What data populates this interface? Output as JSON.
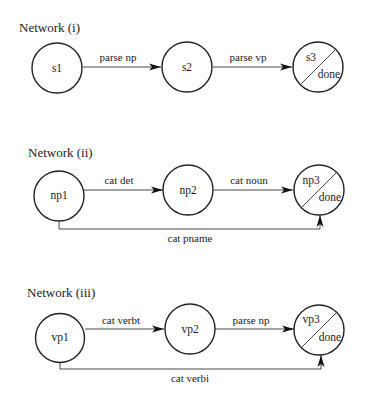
{
  "networks": [
    {
      "title": "Network (i)",
      "nodes": [
        {
          "id": "s1",
          "label": "s1",
          "final": false
        },
        {
          "id": "s2",
          "label": "s2",
          "final": false
        },
        {
          "id": "s3",
          "label": "s3",
          "final": true,
          "final_label": "done"
        }
      ],
      "edges": [
        {
          "from": "s1",
          "to": "s2",
          "label": "parse np",
          "kind": "forward"
        },
        {
          "from": "s2",
          "to": "s3",
          "label": "parse vp",
          "kind": "forward"
        }
      ]
    },
    {
      "title": "Network (ii)",
      "nodes": [
        {
          "id": "np1",
          "label": "np1",
          "final": false
        },
        {
          "id": "np2",
          "label": "np2",
          "final": false
        },
        {
          "id": "np3",
          "label": "np3",
          "final": true,
          "final_label": "done"
        }
      ],
      "edges": [
        {
          "from": "np1",
          "to": "np2",
          "label": "cat det",
          "kind": "forward"
        },
        {
          "from": "np2",
          "to": "np3",
          "label": "cat noun",
          "kind": "forward"
        },
        {
          "from": "np1",
          "to": "np3",
          "label": "cat pname",
          "kind": "bypass"
        }
      ]
    },
    {
      "title": "Network (iii)",
      "nodes": [
        {
          "id": "vp1",
          "label": "vp1",
          "final": false
        },
        {
          "id": "vp2",
          "label": "vp2",
          "final": false
        },
        {
          "id": "vp3",
          "label": "vp3",
          "final": true,
          "final_label": "done"
        }
      ],
      "edges": [
        {
          "from": "vp1",
          "to": "vp2",
          "label": "cat verbt",
          "kind": "forward"
        },
        {
          "from": "vp2",
          "to": "vp3",
          "label": "parse np",
          "kind": "forward"
        },
        {
          "from": "vp1",
          "to": "vp3",
          "label": "cat verbi",
          "kind": "bypass"
        }
      ]
    }
  ]
}
